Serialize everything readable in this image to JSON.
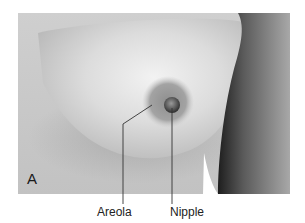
{
  "figure": {
    "panel_letter": "A",
    "labels": {
      "areola": "Areola",
      "nipple": "Nipple"
    },
    "image_description": "grayscale photograph of breast showing areola and nipple, arm on right",
    "colors": {
      "background": "#ffffff",
      "skin_light": "#e8e8e8",
      "skin_mid": "#bdbdbd",
      "areola": "#8a8a8a",
      "nipple": "#4a4a4a",
      "arm_shadow": "#2a2a2a",
      "leader_line": "#333333",
      "label_text": "#222222"
    }
  }
}
